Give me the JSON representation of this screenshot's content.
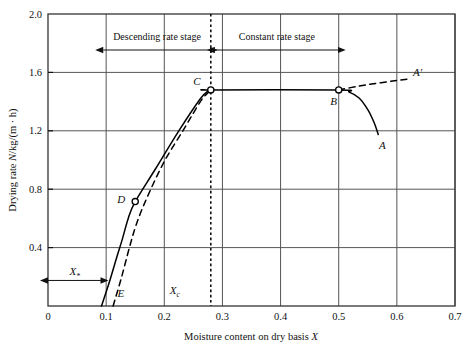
{
  "figure": {
    "title": "",
    "background": "#ffffff",
    "line_color": "#000000",
    "grid_color": "#555555"
  },
  "axes": {
    "x": {
      "label": "Moisture content on dry basis X",
      "label_plain": "Moisture content on dry basis",
      "symbol": "X",
      "ticks": [
        "0",
        "0.1",
        "0.2",
        "0.3",
        "0.4",
        "0.5",
        "0.6",
        "0.7"
      ],
      "tick_values": [
        0,
        0.1,
        0.2,
        0.3,
        0.4,
        0.5,
        0.6,
        0.7
      ],
      "range": [
        0,
        0.7
      ]
    },
    "y": {
      "label": "Drying rate N/kg/(m · h)",
      "label_prefix": "Drying rate ",
      "label_symbol": "N",
      "label_suffix": "/kg/(m · h)",
      "ticks": [
        "0.4",
        "0.8",
        "1.2",
        "1.6",
        "2.0"
      ],
      "tick_values": [
        0.4,
        0.8,
        1.2,
        1.6,
        2.0
      ],
      "range": [
        0,
        2.0
      ]
    }
  },
  "annotations": {
    "stages": [
      {
        "name": "descending-rate-stage",
        "label": "Descending rate stage",
        "x_start": 0.095,
        "x_end": 0.28
      },
      {
        "name": "constant-rate-stage",
        "label": "Constant rate stage",
        "x_start": 0.287,
        "x_end": 0.5
      }
    ],
    "markers": [
      {
        "id": "A",
        "label": "A",
        "x": 0.57,
        "y": 1.17,
        "label_dx": 3,
        "label_dy": 14,
        "marker": false
      },
      {
        "id": "Ap",
        "label": "A′",
        "x": 0.622,
        "y": 1.555,
        "label_dx": 8,
        "label_dy": -3,
        "marker": false
      },
      {
        "id": "B",
        "label": "B",
        "x": 0.5,
        "y": 1.48,
        "label_dx": -5,
        "label_dy": 15,
        "marker": true
      },
      {
        "id": "C",
        "label": "C",
        "x": 0.28,
        "y": 1.48,
        "label_dx": -14,
        "label_dy": -5,
        "marker": true
      },
      {
        "id": "D",
        "label": "D",
        "x": 0.15,
        "y": 0.715,
        "label_dx": -14,
        "label_dy": 1,
        "marker": true
      },
      {
        "id": "E",
        "label": "E",
        "x": 0.122,
        "y": 0.075,
        "label_dx": 2,
        "label_dy": 2,
        "marker": false
      }
    ],
    "x_star": {
      "label_symbol": "X",
      "label_sub": "*",
      "x_start": 0.0,
      "x_end": 0.092,
      "y": 0.175
    },
    "x_c": {
      "label_symbol": "X",
      "label_sub": "c",
      "x": 0.218,
      "y": 0.085
    },
    "critical_line_x": 0.28
  },
  "chart_data": {
    "type": "line",
    "title": "",
    "xlabel": "Moisture content on dry basis X",
    "ylabel": "Drying rate N/kg/(m · h)",
    "xlim": [
      0,
      0.7
    ],
    "ylim": [
      0,
      2.0
    ],
    "grid": true,
    "legend": false,
    "series": [
      {
        "name": "drying-curve-solid",
        "style": "solid",
        "points": [
          [
            0.092,
            0.0
          ],
          [
            0.106,
            0.17
          ],
          [
            0.118,
            0.33
          ],
          [
            0.128,
            0.46
          ],
          [
            0.138,
            0.6
          ],
          [
            0.15,
            0.715
          ],
          [
            0.185,
            0.94
          ],
          [
            0.225,
            1.2
          ],
          [
            0.262,
            1.42
          ],
          [
            0.276,
            1.475
          ],
          [
            0.28,
            1.48
          ],
          [
            0.5,
            1.48
          ],
          [
            0.518,
            1.465
          ],
          [
            0.535,
            1.425
          ],
          [
            0.55,
            1.345
          ],
          [
            0.561,
            1.255
          ],
          [
            0.568,
            1.175
          ]
        ]
      },
      {
        "name": "drying-curve-dashed",
        "style": "dashed",
        "points": [
          [
            0.112,
            0.0
          ],
          [
            0.126,
            0.19
          ],
          [
            0.14,
            0.4
          ],
          [
            0.152,
            0.56
          ],
          [
            0.17,
            0.74
          ],
          [
            0.2,
            0.99
          ],
          [
            0.235,
            1.22
          ],
          [
            0.262,
            1.4
          ],
          [
            0.275,
            1.46
          ],
          [
            0.28,
            1.48
          ]
        ]
      },
      {
        "name": "induction-period-dashed",
        "style": "dashed",
        "points": [
          [
            0.5,
            1.48
          ],
          [
            0.533,
            1.505
          ],
          [
            0.565,
            1.525
          ],
          [
            0.596,
            1.543
          ],
          [
            0.622,
            1.556
          ]
        ]
      }
    ],
    "annotated_points": [
      {
        "label": "A",
        "x": 0.57,
        "y": 1.17
      },
      {
        "label": "A'",
        "x": 0.62,
        "y": 1.56
      },
      {
        "label": "B",
        "x": 0.5,
        "y": 1.48
      },
      {
        "label": "C",
        "x": 0.28,
        "y": 1.48
      },
      {
        "label": "D",
        "x": 0.15,
        "y": 0.72
      },
      {
        "label": "E",
        "x": 0.09,
        "y": 0.0
      }
    ],
    "vertical_reference_lines": [
      {
        "name": "critical-moisture-line",
        "x": 0.28,
        "style": "dashed"
      }
    ]
  }
}
